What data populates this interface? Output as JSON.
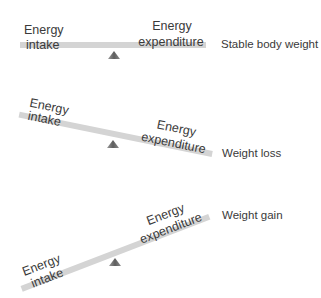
{
  "colors": {
    "beam": "#d4d4d4",
    "fulcrum": "#6e6e6e",
    "text": "#3a3a3a",
    "background": "#ffffff"
  },
  "scales": [
    {
      "state": "stable",
      "left_label_line1": "Energy",
      "left_label_line2": "intake",
      "right_label_line1": "Energy",
      "right_label_line2": "expenditure",
      "outcome": "Stable body weight"
    },
    {
      "state": "loss",
      "left_label_line1": "Energy",
      "left_label_line2": "intake",
      "right_label_line1": "Energy",
      "right_label_line2": "expenditure",
      "outcome": "Weight loss"
    },
    {
      "state": "gain",
      "left_label_line1": "Energy",
      "left_label_line2": "intake",
      "right_label_line1": "Energy",
      "right_label_line2": "expenditure",
      "outcome": "Weight gain"
    }
  ]
}
